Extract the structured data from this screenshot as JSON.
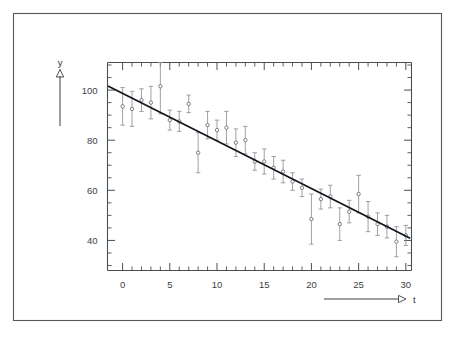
{
  "figure": {
    "background_color": "#ffffff",
    "frame_color": "#555a5e",
    "line_color": "#121418",
    "marker_color": "#5d6268",
    "errorbar_color": "#8d9197"
  },
  "axes": {
    "y_axis_name": "y",
    "x_axis_name": "t",
    "y_tick_labels": [
      "100",
      "80",
      "60",
      "40"
    ],
    "x_tick_labels": [
      "0",
      "5",
      "10",
      "15",
      "20",
      "25",
      "30"
    ]
  },
  "chart_data": {
    "type": "scatter",
    "title": "",
    "subtitle": "",
    "xlabel": "t",
    "ylabel": "y",
    "xlim": [
      -1.6,
      30.6
    ],
    "ylim": [
      28.0,
      111.0
    ],
    "xticks": [
      0,
      5,
      10,
      15,
      20,
      25,
      30
    ],
    "yticks": [
      40,
      60,
      80,
      100
    ],
    "xtick_labels": [
      "0",
      "5",
      "10",
      "15",
      "20",
      "25",
      "30"
    ],
    "ytick_labels": [
      "40",
      "60",
      "80",
      "100"
    ],
    "x_minor_tick_step": 1,
    "y_minor_tick_step": 5,
    "grid": false,
    "legend": null,
    "legend_position": "none",
    "annotations": [],
    "series": [
      {
        "name": "measurements",
        "type": "scatter",
        "marker": "open-circle",
        "has_error_bars": true,
        "error_bar_direction": "vertical",
        "x": [
          0,
          1,
          2,
          3,
          4,
          5,
          6,
          7,
          8,
          9,
          10,
          11,
          12,
          13,
          14,
          15,
          16,
          17,
          18,
          19,
          20,
          21,
          22,
          23,
          24,
          25,
          26,
          27,
          28,
          29,
          30
        ],
        "y": [
          93.5,
          92.5,
          96.0,
          95.0,
          101.5,
          88.0,
          87.5,
          94.5,
          75.0,
          86.0,
          84.0,
          85.0,
          79.0,
          80.0,
          71.5,
          71.5,
          69.0,
          67.5,
          63.5,
          61.0,
          48.5,
          56.5,
          57.5,
          46.5,
          51.5,
          58.5,
          49.5,
          46.5,
          45.5,
          39.5,
          42.0
        ],
        "yerr": [
          7.5,
          7.0,
          4.5,
          6.5,
          11.0,
          4.0,
          4.0,
          3.5,
          8.0,
          5.5,
          4.0,
          6.5,
          5.5,
          5.5,
          3.5,
          5.0,
          4.5,
          4.5,
          3.5,
          3.5,
          10.0,
          4.0,
          4.5,
          6.5,
          4.5,
          7.5,
          6.0,
          4.5,
          4.5,
          6.0,
          4.0
        ]
      },
      {
        "name": "linear-fit",
        "type": "line",
        "x": [
          -1.5,
          30.4
        ],
        "y": [
          101.5,
          41.0
        ]
      }
    ]
  }
}
